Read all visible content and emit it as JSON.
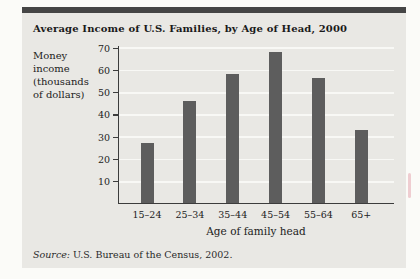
{
  "figure": {
    "title": "Average Income of U.S. Families, by Age of Head, 2000",
    "ylabel_lines": [
      "Money",
      "income",
      "(thousands",
      "of dollars)"
    ],
    "source_prefix": "Source:",
    "source_text": " U.S. Bureau of the Census, 2002."
  },
  "chart_data": {
    "type": "bar",
    "title": "Average Income of U.S. Families, by Age of Head, 2000",
    "categories": [
      "15–24",
      "25–34",
      "35–44",
      "45–54",
      "55–64",
      "65+"
    ],
    "values": [
      27,
      46,
      58,
      68,
      56,
      33
    ],
    "xlabel": "Age of family head",
    "ylabel": "Money income (thousands of dollars)",
    "ylim": [
      0,
      70
    ],
    "yticks": [
      10,
      20,
      30,
      40,
      50,
      60,
      70
    ],
    "grid": true,
    "legend": false,
    "bar_color": "#5d5d5d",
    "source": "U.S. Bureau of the Census, 2002."
  },
  "colors": {
    "page_background": "#fbfbf8",
    "panel_background": "#e9e8e4",
    "top_rule": "#454545",
    "bar": "#5d5d5d",
    "gridline": "#f8f8f5",
    "axis": "#3c3c3c"
  }
}
